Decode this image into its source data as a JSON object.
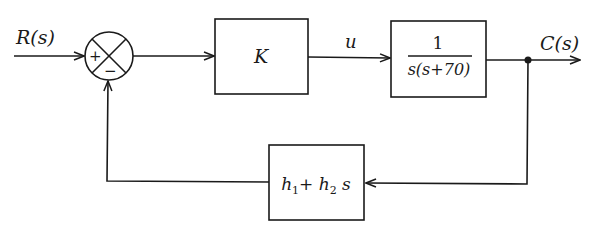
{
  "diagram": {
    "type": "closed-loop control block diagram",
    "input": {
      "label": "R(s)"
    },
    "output": {
      "label": "C(s)"
    },
    "summing_junction": {
      "signs": [
        "+",
        "−"
      ]
    },
    "blocks": [
      {
        "id": "controller",
        "label": "K"
      },
      {
        "id": "plant",
        "numerator": "1",
        "denominator": "s(s+70)"
      },
      {
        "id": "feedback",
        "label_parts": [
          "h",
          "1",
          "+ ",
          "h",
          "2",
          " s"
        ]
      }
    ],
    "signals": [
      {
        "id": "control-signal",
        "label": "u"
      }
    ],
    "colors": {
      "stroke": "#1a1a1a",
      "background": "#ffffff"
    }
  }
}
